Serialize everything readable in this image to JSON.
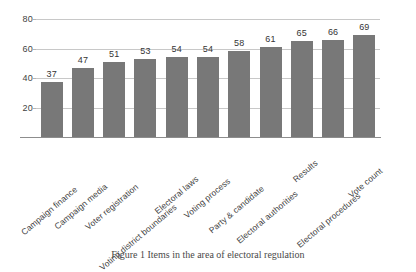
{
  "chart_data": {
    "type": "bar",
    "title": "",
    "subtitle": "",
    "xlabel": "",
    "ylabel": "",
    "ylim": [
      0,
      80
    ],
    "yticks": [
      20,
      40,
      60,
      80
    ],
    "grid": true,
    "legend": null,
    "orientation": "vertical",
    "bar_color": "#787878",
    "gridline_color": "#c8c8c8",
    "axis_color": "#8d8d8d",
    "label_rotation_degrees": -40,
    "categories": [
      "Campaign finance",
      "Campaign media",
      "Voter registration",
      "Voting district boundaries",
      "Electoral laws",
      "Voting process",
      "Party & candidate",
      "Electoral authorities",
      "Results",
      "Electoral procedures",
      "Vote count"
    ],
    "values": [
      37,
      47,
      51,
      53,
      54,
      54,
      58,
      61,
      65,
      66,
      69
    ],
    "data_labels": [
      "37",
      "47",
      "51",
      "53",
      "54",
      "54",
      "58",
      "61",
      "65",
      "66",
      "69"
    ]
  },
  "caption": {
    "text": "Figure 1 Items in the area of electoral regulation"
  }
}
